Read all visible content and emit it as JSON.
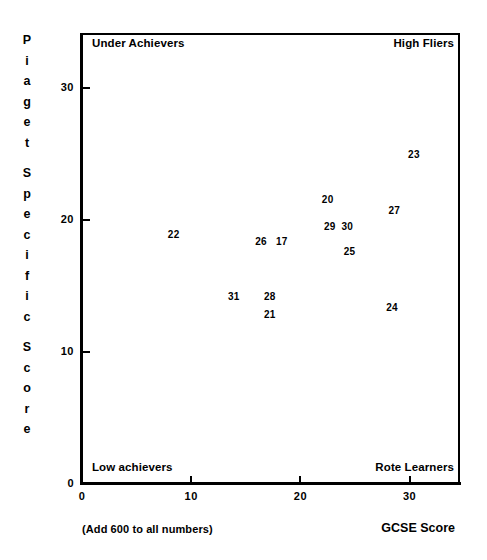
{
  "chart_data": {
    "type": "scatter",
    "title": "",
    "xlabel": "GCSE Score",
    "ylabel": "Piaget Specific Score",
    "xlim": [
      0,
      34.7
    ],
    "ylim": [
      0,
      34.2
    ],
    "xticks": [
      0,
      10,
      20,
      30
    ],
    "xtick_labels": [
      "0",
      "10",
      "20",
      "30"
    ],
    "yticks": [
      0,
      10,
      20,
      30
    ],
    "ytick_labels": [
      "0",
      "10",
      "20",
      "30"
    ],
    "grid": false,
    "legend": "none",
    "note": "(Add 600 to all numbers)",
    "marker_style": "numeric-label",
    "points": [
      {
        "label": "22",
        "x": 8.4,
        "y": 18.9
      },
      {
        "label": "26",
        "x": 16.4,
        "y": 18.3
      },
      {
        "label": "17",
        "x": 18.3,
        "y": 18.3
      },
      {
        "label": "20",
        "x": 22.5,
        "y": 21.5
      },
      {
        "label": "29",
        "x": 22.7,
        "y": 19.5
      },
      {
        "label": "30",
        "x": 24.3,
        "y": 19.5
      },
      {
        "label": "25",
        "x": 24.5,
        "y": 17.6
      },
      {
        "label": "27",
        "x": 28.6,
        "y": 20.7
      },
      {
        "label": "23",
        "x": 30.4,
        "y": 24.9
      },
      {
        "label": "31",
        "x": 13.9,
        "y": 14.2
      },
      {
        "label": "28",
        "x": 17.2,
        "y": 14.2
      },
      {
        "label": "21",
        "x": 17.2,
        "y": 12.8
      },
      {
        "label": "24",
        "x": 28.4,
        "y": 13.3
      }
    ],
    "quadrant_labels": [
      {
        "name": "top-left",
        "text": "Under Achievers"
      },
      {
        "name": "top-right",
        "text": "High Fliers"
      },
      {
        "name": "bottom-left",
        "text": "Low achievers"
      },
      {
        "name": "bottom-right",
        "text": "Rote Learners"
      }
    ]
  },
  "axes": {
    "y_title_letters": [
      "P",
      "i",
      "a",
      "g",
      "e",
      "t",
      "",
      "S",
      "p",
      "e",
      "c",
      "i",
      "f",
      "i",
      "c",
      "",
      "S",
      "c",
      "o",
      "r",
      "e"
    ],
    "x_title": "GCSE Score"
  },
  "quadrants": {
    "under_achievers": "Under Achievers",
    "high_fliers": "High Fliers",
    "low_achievers": "Low achievers",
    "rote_learners": "Rote Learners"
  },
  "ticks": {
    "x": [
      "0",
      "10",
      "20",
      "30"
    ],
    "y": [
      "0",
      "10",
      "20",
      "30"
    ]
  },
  "footnote": "(Add 600 to all numbers)",
  "colors": {
    "ink": "#000000",
    "paper": "#ffffff"
  }
}
